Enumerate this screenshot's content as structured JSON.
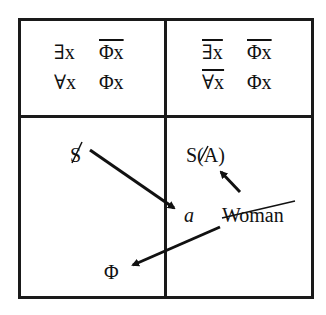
{
  "quadrants": {
    "top_left": {
      "row1": {
        "quantifier": "∃x",
        "predicate": "Φx",
        "quantifier_negated": false,
        "predicate_negated": true
      },
      "row2": {
        "quantifier": "∀x",
        "predicate": "Φx",
        "quantifier_negated": false,
        "predicate_negated": false
      }
    },
    "top_right": {
      "row1": {
        "quantifier": "∃x",
        "predicate": "Φx",
        "quantifier_negated": true,
        "predicate_negated": true
      },
      "row2": {
        "quantifier": "∀x",
        "predicate": "Φx",
        "quantifier_negated": true,
        "predicate_negated": false
      }
    },
    "bottom_left": {
      "barred_s": "S",
      "phi": "Φ"
    },
    "bottom_right": {
      "s_of_a": {
        "prefix": "S(",
        "barred_a": "A",
        "suffix": ")"
      },
      "a_label": "a",
      "woman": "Woman"
    }
  },
  "arrows": [
    {
      "from": "barred_s",
      "to": "a"
    },
    {
      "from": "woman",
      "to": "phi"
    },
    {
      "from": "a_region",
      "to": "s_of_a"
    }
  ],
  "colors": {
    "ink": "#111111",
    "background": "#ffffff"
  }
}
